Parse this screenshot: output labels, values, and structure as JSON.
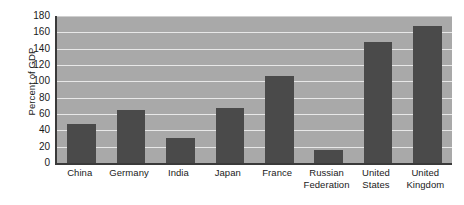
{
  "chart_data": {
    "type": "bar",
    "title": "",
    "subtitle": "",
    "xlabel": "",
    "ylabel": "Percent of GDP",
    "ylim": [
      0,
      180
    ],
    "ytick_step": 20,
    "yticks": [
      0,
      20,
      40,
      60,
      80,
      100,
      120,
      140,
      160,
      180
    ],
    "grid": true,
    "legend": false,
    "legend_position": "none",
    "categories": [
      "China",
      "Germany",
      "India",
      "Japan",
      "France",
      "Russian Federation",
      "United States",
      "United Kingdom"
    ],
    "category_lines": [
      [
        "China"
      ],
      [
        "Germany"
      ],
      [
        "India"
      ],
      [
        "Japan"
      ],
      [
        "France"
      ],
      [
        "Russian",
        "Federation"
      ],
      [
        "United",
        "States"
      ],
      [
        "United",
        "Kingdom"
      ]
    ],
    "values": [
      48,
      65,
      31,
      67,
      106,
      16,
      148,
      168
    ],
    "annotations": []
  },
  "style": {
    "bar_color": "#4a4a4a",
    "plot_background": "#a9a9a9",
    "gridline_color": "#e8e8e8",
    "axis_color": "#3a3a3a",
    "text_color": "#1a1a1a",
    "page_background": "#ffffff"
  }
}
